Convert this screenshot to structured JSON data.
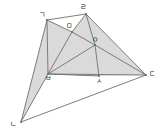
{
  "figure": {
    "type": "geometry-diagram",
    "title": "",
    "background_color": "#ffffff",
    "stroke_color": "#6e6e6e",
    "fill_color": "#d4d4d4",
    "fill_opacity": 0.85,
    "label_color": "#1c1c1c",
    "vertices": [
      {
        "id": "g",
        "label": "ㄱ",
        "x": 47,
        "y": 20,
        "label_x": 39,
        "label_y": 11
      },
      {
        "id": "r",
        "label": "ㄹ",
        "x": 86,
        "y": 14,
        "label_x": 80,
        "label_y": 3
      },
      {
        "id": "m",
        "label": "ㅁ",
        "x": 72,
        "y": 32,
        "label_x": 66,
        "label_y": 22
      },
      {
        "id": "o",
        "label": "ㅇ",
        "x": 95,
        "y": 45,
        "label_x": 92,
        "label_y": 36
      },
      {
        "id": "b",
        "label": "ㅂ",
        "x": 48,
        "y": 74,
        "label_x": 45,
        "label_y": 74
      },
      {
        "id": "s",
        "label": "ㅅ",
        "x": 99,
        "y": 76,
        "label_x": 96,
        "label_y": 77
      },
      {
        "id": "d",
        "label": "ㄷ",
        "x": 146,
        "y": 75,
        "label_x": 149,
        "label_y": 70
      },
      {
        "id": "n",
        "label": "ㄴ",
        "x": 21,
        "y": 122,
        "label_x": 10,
        "label_y": 120
      }
    ],
    "shaded_regions": [
      {
        "name": "region-g-m-b",
        "points": "47,20 72,32 48,74"
      },
      {
        "name": "region-g-b-n",
        "points": "47,20 48,74 21,122"
      },
      {
        "name": "region-m-o-b",
        "points": "72,32 95,45 48,74"
      },
      {
        "name": "region-r-o-m",
        "points": "86,14 95,45 72,32"
      },
      {
        "name": "region-b-o-s",
        "points": "48,74 95,45 99,76"
      },
      {
        "name": "region-s-o-d",
        "points": "99,76 95,45 146,75"
      },
      {
        "name": "region-r-d-o",
        "points": "86,14 146,75 95,45"
      }
    ],
    "edges": [
      {
        "name": "edge-g-r",
        "x1": 47,
        "y1": 20,
        "x2": 86,
        "y2": 14
      },
      {
        "name": "edge-g-m",
        "x1": 47,
        "y1": 20,
        "x2": 72,
        "y2": 32
      },
      {
        "name": "edge-g-b",
        "x1": 47,
        "y1": 20,
        "x2": 48,
        "y2": 74
      },
      {
        "name": "edge-g-n",
        "x1": 47,
        "y1": 20,
        "x2": 21,
        "y2": 122
      },
      {
        "name": "edge-r-m",
        "x1": 86,
        "y1": 14,
        "x2": 72,
        "y2": 32
      },
      {
        "name": "edge-r-o",
        "x1": 86,
        "y1": 14,
        "x2": 95,
        "y2": 45
      },
      {
        "name": "edge-r-d",
        "x1": 86,
        "y1": 14,
        "x2": 146,
        "y2": 75
      },
      {
        "name": "edge-m-b",
        "x1": 72,
        "y1": 32,
        "x2": 48,
        "y2": 74
      },
      {
        "name": "edge-m-o",
        "x1": 72,
        "y1": 32,
        "x2": 95,
        "y2": 45
      },
      {
        "name": "edge-b-o",
        "x1": 48,
        "y1": 74,
        "x2": 95,
        "y2": 45
      },
      {
        "name": "edge-b-n",
        "x1": 48,
        "y1": 74,
        "x2": 21,
        "y2": 122
      },
      {
        "name": "edge-b-s",
        "x1": 48,
        "y1": 74,
        "x2": 99,
        "y2": 76
      },
      {
        "name": "edge-b-d",
        "x1": 48,
        "y1": 74,
        "x2": 146,
        "y2": 75
      },
      {
        "name": "edge-o-s",
        "x1": 95,
        "y1": 45,
        "x2": 99,
        "y2": 76
      },
      {
        "name": "edge-o-d",
        "x1": 95,
        "y1": 45,
        "x2": 146,
        "y2": 75
      },
      {
        "name": "edge-n-d",
        "x1": 21,
        "y1": 122,
        "x2": 146,
        "y2": 75
      }
    ]
  }
}
